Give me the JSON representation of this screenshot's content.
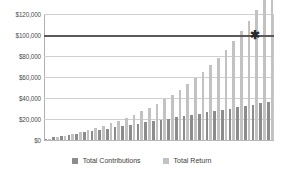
{
  "chart_data": {
    "type": "bar",
    "title": "",
    "xlabel": "",
    "ylabel": "",
    "ylim": [
      0,
      120000
    ],
    "ytick_labels": [
      "$120,000",
      "$100,000",
      "$80,000",
      "$60,000",
      "$40,000",
      "$20,000",
      "$0"
    ],
    "ytick_values": [
      120000,
      100000,
      80000,
      60000,
      40000,
      20000,
      0
    ],
    "grid": true,
    "legend_position": "bottom",
    "categories": [
      "1",
      "2",
      "3",
      "4",
      "5",
      "6",
      "7",
      "8",
      "9",
      "10",
      "11",
      "12",
      "13",
      "14",
      "15",
      "16",
      "17",
      "18",
      "19",
      "20",
      "21",
      "22",
      "23",
      "24",
      "25",
      "26",
      "27",
      "28",
      "29",
      "30"
    ],
    "series": [
      {
        "name": "Total Contributions",
        "color": "#8c8c8c",
        "values": [
          1200,
          2400,
          3600,
          4800,
          6000,
          7200,
          8400,
          9600,
          10800,
          12000,
          13200,
          14400,
          15600,
          16800,
          18000,
          19200,
          20400,
          21600,
          22800,
          24000,
          25200,
          26400,
          27600,
          28800,
          30000,
          31200,
          32400,
          33600,
          34800,
          36000
        ]
      },
      {
        "name": "Total Return",
        "color": "#c2c2c2",
        "values": [
          1250,
          2600,
          4100,
          5700,
          7400,
          9300,
          11300,
          13500,
          15900,
          18400,
          21200,
          24200,
          27400,
          30900,
          34700,
          38800,
          43200,
          48000,
          53200,
          58800,
          64900,
          71400,
          78500,
          86200,
          94500,
          103500,
          113200,
          123700,
          135100,
          147400
        ]
      }
    ],
    "reference_line": {
      "value": 100000,
      "label": "$100,000",
      "color": "#5a5a5a",
      "marker": "✱",
      "marker_name": "asterisk-marker",
      "marker_x_category": "28"
    }
  },
  "legend": {
    "items": [
      {
        "label": "Total Contributions",
        "color": "#8c8c8c"
      },
      {
        "label": "Total Return",
        "color": "#c2c2c2"
      }
    ]
  }
}
